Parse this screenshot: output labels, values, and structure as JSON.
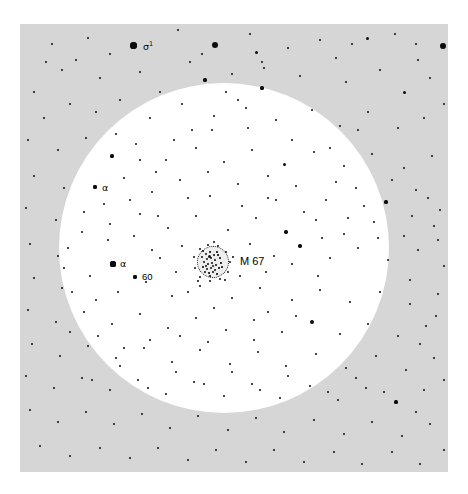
{
  "figure": {
    "kind": "star-chart",
    "background_color": "#ffffff",
    "sky_field_color": "#d6d6d6",
    "field_of_view_color": "#ffffff",
    "star_color": "#0d0d0d"
  },
  "sky_panel": {
    "x": 20,
    "y": 24,
    "width": 428,
    "height": 448
  },
  "field_of_view": {
    "cx": 224,
    "cy": 248,
    "r": 165
  },
  "cluster": {
    "name": "M 67",
    "label": "M 67",
    "cx": 213,
    "cy": 262,
    "r": 16,
    "label_x": 240,
    "label_y": 256
  },
  "labels": [
    {
      "name": "sigma-1",
      "text": "σ",
      "superscript": "1",
      "x": 143,
      "y": 41,
      "kind": "greek-sup"
    },
    {
      "name": "alpha-upper",
      "text": "α",
      "x": 102,
      "y": 183,
      "kind": "greek"
    },
    {
      "name": "alpha-lower",
      "text": "α",
      "x": 120,
      "y": 259,
      "kind": "greek"
    },
    {
      "name": "star-60",
      "text": "60",
      "x": 142,
      "y": 272,
      "kind": "number"
    }
  ],
  "labelled_stars": [
    {
      "name": "sigma-1-star",
      "x": 133,
      "y": 45,
      "d": 7.0
    },
    {
      "name": "alpha-upper-star",
      "x": 95,
      "y": 187,
      "d": 4.6
    },
    {
      "name": "alpha-lower-star",
      "x": 113,
      "y": 264,
      "d": 5.2
    },
    {
      "name": "star-60-star",
      "x": 135,
      "y": 277,
      "d": 4.6
    }
  ],
  "stars": [
    [
      133,
      45,
      7.0
    ],
    [
      215,
      45,
      6.0
    ],
    [
      256,
      52,
      3.0
    ],
    [
      443,
      46,
      5.8
    ],
    [
      367,
      38,
      3.0
    ],
    [
      88,
      38,
      2.4
    ],
    [
      110,
      54,
      2.6
    ],
    [
      178,
      30,
      2.2
    ],
    [
      190,
      62,
      2.2
    ],
    [
      250,
      34,
      2.2
    ],
    [
      288,
      48,
      2.4
    ],
    [
      320,
      40,
      2.2
    ],
    [
      336,
      58,
      2.4
    ],
    [
      395,
      34,
      2.2
    ],
    [
      418,
      60,
      2.6
    ],
    [
      52,
      44,
      2.4
    ],
    [
      62,
      70,
      2.4
    ],
    [
      100,
      78,
      2.2
    ],
    [
      140,
      72,
      2.0
    ],
    [
      160,
      92,
      2.4
    ],
    [
      205,
      80,
      3.2
    ],
    [
      232,
      74,
      2.2
    ],
    [
      262,
      88,
      3.2
    ],
    [
      300,
      76,
      2.4
    ],
    [
      346,
      82,
      2.6
    ],
    [
      380,
      70,
      2.2
    ],
    [
      404,
      92,
      3.0
    ],
    [
      430,
      78,
      2.4
    ],
    [
      444,
      104,
      2.6
    ],
    [
      34,
      92,
      2.4
    ],
    [
      44,
      118,
      2.6
    ],
    [
      70,
      104,
      2.2
    ],
    [
      96,
      112,
      2.0
    ],
    [
      120,
      100,
      2.2
    ],
    [
      150,
      118,
      2.2
    ],
    [
      182,
      104,
      2.4
    ],
    [
      214,
      116,
      2.2
    ],
    [
      246,
      108,
      2.6
    ],
    [
      276,
      120,
      2.4
    ],
    [
      312,
      110,
      2.2
    ],
    [
      340,
      126,
      2.6
    ],
    [
      368,
      112,
      2.2
    ],
    [
      398,
      128,
      2.4
    ],
    [
      424,
      118,
      2.2
    ],
    [
      28,
      140,
      2.2
    ],
    [
      58,
      150,
      2.6
    ],
    [
      86,
      138,
      2.2
    ],
    [
      112,
      156,
      3.2
    ],
    [
      136,
      144,
      2.4
    ],
    [
      166,
      160,
      2.6
    ],
    [
      196,
      148,
      2.2
    ],
    [
      224,
      162,
      2.2
    ],
    [
      252,
      150,
      2.4
    ],
    [
      284,
      164,
      3.0
    ],
    [
      314,
      152,
      2.2
    ],
    [
      344,
      166,
      2.4
    ],
    [
      372,
      154,
      2.2
    ],
    [
      404,
      168,
      2.6
    ],
    [
      432,
      156,
      2.2
    ],
    [
      34,
      176,
      2.4
    ],
    [
      64,
      188,
      2.6
    ],
    [
      95,
      187,
      4.6
    ],
    [
      124,
      178,
      2.2
    ],
    [
      152,
      192,
      2.4
    ],
    [
      180,
      180,
      2.2
    ],
    [
      210,
      196,
      2.6
    ],
    [
      238,
      184,
      2.2
    ],
    [
      268,
      198,
      2.4
    ],
    [
      296,
      186,
      2.6
    ],
    [
      326,
      200,
      2.2
    ],
    [
      356,
      188,
      2.4
    ],
    [
      386,
      202,
      3.2
    ],
    [
      416,
      190,
      2.4
    ],
    [
      440,
      210,
      2.6
    ],
    [
      26,
      208,
      2.4
    ],
    [
      56,
      220,
      2.6
    ],
    [
      84,
      212,
      2.2
    ],
    [
      110,
      224,
      2.4
    ],
    [
      140,
      214,
      2.2
    ],
    [
      168,
      228,
      2.4
    ],
    [
      196,
      216,
      2.2
    ],
    [
      228,
      230,
      2.4
    ],
    [
      256,
      218,
      2.2
    ],
    [
      286,
      232,
      3.4
    ],
    [
      316,
      220,
      2.4
    ],
    [
      344,
      234,
      2.2
    ],
    [
      374,
      222,
      2.4
    ],
    [
      404,
      236,
      2.6
    ],
    [
      434,
      226,
      2.4
    ],
    [
      30,
      244,
      2.4
    ],
    [
      58,
      256,
      2.6
    ],
    [
      113,
      264,
      5.2
    ],
    [
      135,
      277,
      4.6
    ],
    [
      160,
      258,
      2.2
    ],
    [
      182,
      246,
      2.4
    ],
    [
      250,
      244,
      2.2
    ],
    [
      274,
      256,
      2.6
    ],
    [
      300,
      246,
      3.4
    ],
    [
      330,
      258,
      2.4
    ],
    [
      358,
      248,
      2.2
    ],
    [
      388,
      260,
      2.6
    ],
    [
      418,
      250,
      2.4
    ],
    [
      444,
      266,
      2.6
    ],
    [
      34,
      278,
      2.4
    ],
    [
      62,
      288,
      2.6
    ],
    [
      90,
      276,
      2.2
    ],
    [
      118,
      292,
      2.4
    ],
    [
      146,
      282,
      2.2
    ],
    [
      172,
      296,
      2.4
    ],
    [
      200,
      286,
      2.2
    ],
    [
      232,
      298,
      2.6
    ],
    [
      260,
      288,
      2.2
    ],
    [
      292,
      300,
      2.4
    ],
    [
      320,
      290,
      2.6
    ],
    [
      350,
      302,
      2.2
    ],
    [
      380,
      292,
      2.4
    ],
    [
      410,
      304,
      2.6
    ],
    [
      438,
      294,
      2.4
    ],
    [
      28,
      310,
      2.4
    ],
    [
      56,
      322,
      2.6
    ],
    [
      84,
      312,
      2.2
    ],
    [
      112,
      324,
      2.4
    ],
    [
      140,
      314,
      2.2
    ],
    [
      168,
      328,
      2.4
    ],
    [
      196,
      318,
      2.2
    ],
    [
      226,
      330,
      2.6
    ],
    [
      254,
      320,
      2.2
    ],
    [
      282,
      332,
      2.4
    ],
    [
      312,
      322,
      4.8
    ],
    [
      340,
      334,
      2.4
    ],
    [
      368,
      324,
      2.2
    ],
    [
      398,
      336,
      2.6
    ],
    [
      426,
      326,
      2.4
    ],
    [
      32,
      344,
      2.4
    ],
    [
      60,
      356,
      2.6
    ],
    [
      88,
      346,
      2.2
    ],
    [
      116,
      358,
      2.4
    ],
    [
      144,
      348,
      2.2
    ],
    [
      172,
      362,
      2.4
    ],
    [
      200,
      350,
      2.2
    ],
    [
      230,
      364,
      2.6
    ],
    [
      258,
      352,
      2.2
    ],
    [
      286,
      366,
      2.4
    ],
    [
      316,
      354,
      2.6
    ],
    [
      346,
      368,
      2.2
    ],
    [
      376,
      356,
      2.4
    ],
    [
      406,
      370,
      2.6
    ],
    [
      434,
      358,
      2.4
    ],
    [
      26,
      376,
      2.4
    ],
    [
      54,
      388,
      2.6
    ],
    [
      82,
      378,
      2.2
    ],
    [
      110,
      390,
      2.4
    ],
    [
      138,
      380,
      2.2
    ],
    [
      166,
      394,
      2.4
    ],
    [
      194,
      382,
      2.2
    ],
    [
      224,
      396,
      2.6
    ],
    [
      252,
      384,
      2.2
    ],
    [
      280,
      398,
      2.4
    ],
    [
      310,
      386,
      2.6
    ],
    [
      338,
      400,
      2.2
    ],
    [
      366,
      388,
      2.4
    ],
    [
      396,
      402,
      3.2
    ],
    [
      424,
      390,
      2.4
    ],
    [
      30,
      410,
      2.4
    ],
    [
      58,
      422,
      2.6
    ],
    [
      86,
      412,
      2.2
    ],
    [
      114,
      424,
      2.4
    ],
    [
      142,
      414,
      2.2
    ],
    [
      170,
      428,
      2.4
    ],
    [
      198,
      416,
      2.2
    ],
    [
      228,
      430,
      2.6
    ],
    [
      256,
      418,
      2.2
    ],
    [
      284,
      432,
      2.4
    ],
    [
      314,
      420,
      2.6
    ],
    [
      344,
      434,
      2.2
    ],
    [
      372,
      422,
      2.4
    ],
    [
      402,
      436,
      2.6
    ],
    [
      430,
      424,
      2.4
    ],
    [
      40,
      446,
      2.4
    ],
    [
      70,
      456,
      2.6
    ],
    [
      100,
      448,
      2.2
    ],
    [
      130,
      458,
      2.4
    ],
    [
      158,
      448,
      2.2
    ],
    [
      188,
      460,
      2.4
    ],
    [
      216,
      450,
      2.2
    ],
    [
      246,
      462,
      2.6
    ],
    [
      274,
      450,
      2.2
    ],
    [
      304,
      462,
      2.4
    ],
    [
      334,
      452,
      2.6
    ],
    [
      362,
      464,
      2.2
    ],
    [
      392,
      452,
      2.4
    ],
    [
      420,
      464,
      2.6
    ],
    [
      444,
      450,
      2.4
    ],
    [
      262,
      62,
      2.0
    ],
    [
      264,
      68,
      2.0
    ],
    [
      352,
      44,
      2.0
    ],
    [
      416,
      44,
      2.2
    ],
    [
      76,
      60,
      2.0
    ],
    [
      46,
      62,
      2.0
    ],
    [
      202,
      54,
      2.0
    ],
    [
      226,
      92,
      2.2
    ],
    [
      238,
      100,
      2.0
    ],
    [
      192,
      130,
      2.0
    ],
    [
      174,
      140,
      2.0
    ],
    [
      156,
      172,
      2.0
    ],
    [
      130,
      200,
      2.0
    ],
    [
      104,
      204,
      2.0
    ],
    [
      108,
      240,
      2.0
    ],
    [
      134,
      236,
      2.0
    ],
    [
      152,
      250,
      2.0
    ],
    [
      176,
      272,
      2.0
    ],
    [
      188,
      292,
      2.0
    ],
    [
      214,
      308,
      2.0
    ],
    [
      240,
      276,
      2.0
    ],
    [
      266,
      272,
      2.0
    ],
    [
      292,
      264,
      2.0
    ],
    [
      318,
      276,
      2.0
    ],
    [
      268,
      312,
      2.2
    ],
    [
      296,
      316,
      2.0
    ],
    [
      254,
      340,
      2.0
    ],
    [
      208,
      342,
      2.0
    ],
    [
      180,
      336,
      2.0
    ],
    [
      150,
      340,
      2.0
    ],
    [
      124,
      348,
      2.0
    ],
    [
      98,
      336,
      2.0
    ],
    [
      70,
      332,
      2.0
    ],
    [
      92,
      380,
      2.0
    ],
    [
      120,
      366,
      2.0
    ],
    [
      148,
      388,
      2.0
    ],
    [
      176,
      372,
      2.0
    ],
    [
      204,
      384,
      2.0
    ],
    [
      232,
      372,
      2.0
    ],
    [
      260,
      390,
      2.0
    ],
    [
      288,
      376,
      2.0
    ],
    [
      328,
      392,
      2.0
    ],
    [
      356,
      378,
      2.0
    ],
    [
      384,
      392,
      2.0
    ],
    [
      68,
      248,
      2.0
    ],
    [
      82,
      232,
      2.0
    ],
    [
      96,
      300,
      2.0
    ],
    [
      72,
      292,
      2.0
    ],
    [
      64,
      268,
      2.0
    ],
    [
      412,
      216,
      2.0
    ],
    [
      428,
      198,
      2.0
    ],
    [
      438,
      240,
      2.0
    ],
    [
      410,
      280,
      2.0
    ],
    [
      436,
      316,
      2.0
    ],
    [
      420,
      344,
      2.0
    ],
    [
      444,
      380,
      2.0
    ],
    [
      416,
      412,
      2.0
    ],
    [
      188,
      198,
      2.0
    ],
    [
      208,
      172,
      2.0
    ],
    [
      242,
      206,
      2.0
    ],
    [
      268,
      176,
      2.0
    ],
    [
      158,
      216,
      2.0
    ],
    [
      140,
      160,
      2.0
    ],
    [
      116,
      134,
      2.0
    ],
    [
      212,
      130,
      2.0
    ],
    [
      248,
      128,
      2.0
    ],
    [
      292,
      140,
      2.0
    ],
    [
      330,
      148,
      2.0
    ],
    [
      358,
      130,
      2.0
    ],
    [
      276,
      200,
      2.0
    ],
    [
      304,
      212,
      2.0
    ],
    [
      336,
      182,
      2.0
    ],
    [
      364,
      206,
      2.0
    ],
    [
      392,
      180,
      2.0
    ],
    [
      348,
      218,
      2.0
    ],
    [
      378,
      238,
      2.0
    ],
    [
      322,
      238,
      2.0
    ]
  ],
  "cluster_dots": [
    [
      6,
      5,
      1.6
    ],
    [
      9,
      8,
      2.2
    ],
    [
      13,
      6,
      1.6
    ],
    [
      17,
      9,
      1.8
    ],
    [
      20,
      6,
      1.5
    ],
    [
      5,
      11,
      1.8
    ],
    [
      10,
      13,
      2.6
    ],
    [
      14,
      12,
      2.4
    ],
    [
      18,
      14,
      2.0
    ],
    [
      23,
      12,
      1.6
    ],
    [
      7,
      16,
      2.0
    ],
    [
      11,
      18,
      2.8
    ],
    [
      15,
      17,
      2.2
    ],
    [
      19,
      19,
      1.8
    ],
    [
      24,
      17,
      1.5
    ],
    [
      6,
      21,
      1.6
    ],
    [
      10,
      23,
      2.2
    ],
    [
      14,
      22,
      2.0
    ],
    [
      18,
      24,
      1.8
    ],
    [
      22,
      22,
      1.6
    ],
    [
      8,
      26,
      1.8
    ],
    [
      12,
      27,
      1.6
    ],
    [
      16,
      26,
      1.8
    ],
    [
      20,
      28,
      1.5
    ],
    [
      12,
      10,
      3.0
    ],
    [
      16,
      20,
      2.6
    ],
    [
      9,
      20,
      2.0
    ],
    [
      21,
      9,
      1.6
    ],
    [
      25,
      21,
      1.5
    ],
    [
      13,
      30,
      1.5
    ]
  ],
  "cluster_halo_dots": [
    [
      200,
      249,
      2.0
    ],
    [
      208,
      245,
      2.4
    ],
    [
      218,
      246,
      2.0
    ],
    [
      226,
      252,
      2.2
    ],
    [
      230,
      262,
      2.0
    ],
    [
      228,
      272,
      2.2
    ],
    [
      220,
      279,
      2.0
    ],
    [
      210,
      281,
      2.4
    ],
    [
      200,
      277,
      2.0
    ],
    [
      195,
      268,
      2.2
    ],
    [
      194,
      257,
      2.0
    ],
    [
      214,
      242,
      2.0
    ],
    [
      233,
      257,
      1.8
    ],
    [
      225,
      280,
      1.8
    ],
    [
      198,
      281,
      1.8
    ]
  ]
}
